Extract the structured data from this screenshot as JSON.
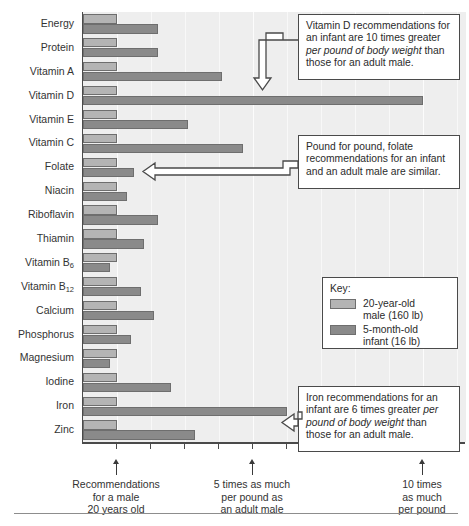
{
  "chart_data": {
    "type": "bar",
    "orientation": "horizontal",
    "title": "",
    "xlabel": "",
    "ylabel": "",
    "grid": true,
    "xlim": [
      0,
      11.6
    ],
    "xtick_values": [
      1,
      2,
      3,
      4,
      5,
      6,
      7,
      8,
      9,
      10,
      11
    ],
    "labeled_ticks": [
      {
        "value": 1,
        "label": "Recommendations\nfor a male\n20 years old"
      },
      {
        "value": 5,
        "label": "5 times as much\nper pound as\nan adult male"
      },
      {
        "value": 10,
        "label": "10 times\nas much\nper pound"
      }
    ],
    "categories": [
      "Energy",
      "Protein",
      "Vitamin A",
      "Vitamin D",
      "Vitamin E",
      "Vitamin C",
      "Folate",
      "Niacin",
      "Riboflavin",
      "Thiamin",
      "Vitamin B6",
      "Vitamin B12",
      "Calcium",
      "Phosphorus",
      "Magnesium",
      "Iodine",
      "Iron",
      "Zinc"
    ],
    "series": [
      {
        "name": "20-year-old male (160 lb)",
        "color": "#b4b4b4",
        "values": [
          1,
          1,
          1,
          1,
          1,
          1,
          1,
          1,
          1,
          1,
          1,
          1,
          1,
          1,
          1,
          1,
          1,
          1
        ]
      },
      {
        "name": "5-month-old infant (16 lb)",
        "color": "#8a8a8a",
        "values": [
          2.2,
          2.2,
          4.1,
          10.0,
          3.1,
          4.7,
          1.5,
          1.3,
          2.2,
          1.8,
          0.8,
          1.7,
          2.1,
          1.4,
          0.8,
          2.6,
          6.0,
          3.3
        ]
      }
    ],
    "legend_position": "inside-right"
  },
  "categories_display": [
    {
      "label": "Energy",
      "sub": ""
    },
    {
      "label": "Protein",
      "sub": ""
    },
    {
      "label": "Vitamin A",
      "sub": ""
    },
    {
      "label": "Vitamin D",
      "sub": ""
    },
    {
      "label": "Vitamin E",
      "sub": ""
    },
    {
      "label": "Vitamin C",
      "sub": ""
    },
    {
      "label": "Folate",
      "sub": ""
    },
    {
      "label": "Niacin",
      "sub": ""
    },
    {
      "label": "Riboflavin",
      "sub": ""
    },
    {
      "label": "Thiamin",
      "sub": ""
    },
    {
      "label": "Vitamin B",
      "sub": "6"
    },
    {
      "label": "Vitamin B",
      "sub": "12"
    },
    {
      "label": "Calcium",
      "sub": ""
    },
    {
      "label": "Phosphorus",
      "sub": ""
    },
    {
      "label": "Magnesium",
      "sub": ""
    },
    {
      "label": "Iodine",
      "sub": ""
    },
    {
      "label": "Iron",
      "sub": ""
    },
    {
      "label": "Zinc",
      "sub": ""
    }
  ],
  "axis_notes": [
    {
      "line1": "Recommendations",
      "line2": "for a male",
      "line3": "20 years old"
    },
    {
      "line1": "5 times as much",
      "line2": "per pound as",
      "line3": "an adult male"
    },
    {
      "line1": "10 times",
      "line2": "as much",
      "line3": "per pound"
    }
  ],
  "callouts": [
    {
      "id": "vitamin-d",
      "text_parts": [
        {
          "text": "Vitamin D recommendations for an infant are 10 times greater ",
          "italic": false
        },
        {
          "text": "per pound of body weight",
          "italic": true
        },
        {
          "text": " than those for an adult male.",
          "italic": false
        }
      ],
      "plain_text": "Vitamin D recommendations for an infant are 10 times greater per pound of body weight than those for an adult male."
    },
    {
      "id": "folate",
      "text_parts": [
        {
          "text": "Pound for pound, folate recommendations for an infant and an adult male are similar.",
          "italic": false
        }
      ],
      "plain_text": "Pound for pound, folate recommendations for an infant and an adult male are similar."
    },
    {
      "id": "iron",
      "text_parts": [
        {
          "text": "Iron recommendations for an infant are 6 times greater ",
          "italic": false
        },
        {
          "text": "per pound of body weight",
          "italic": true
        },
        {
          "text": " than those for an adult male.",
          "italic": false
        }
      ],
      "plain_text": "Iron recommendations for an infant are 6 times greater per pound of body weight than those for an adult male."
    }
  ],
  "key": {
    "title": "Key:",
    "entries": [
      {
        "swatch": "light",
        "line1": "20-year-old",
        "line2": "male (160 lb)"
      },
      {
        "swatch": "dark",
        "line1": "5-month-old",
        "line2": "infant (16 lb)"
      }
    ]
  },
  "colors": {
    "bar_light": "#b4b4b4",
    "bar_dark": "#8a8a8a",
    "plot_background": "#eeeeee",
    "axis": "#4a4a4a",
    "text": "#2b2b2b"
  }
}
